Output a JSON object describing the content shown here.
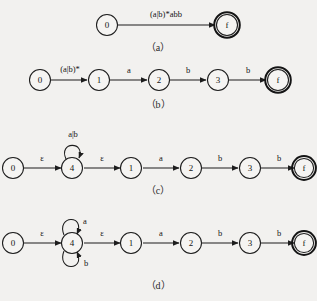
{
  "figure": {
    "background_color": "#f2f1ef",
    "ink_color": "#1d1d1d",
    "panels": [
      {
        "id": "a",
        "caption": "（a）",
        "states": [
          {
            "name": "0",
            "accepting": false
          },
          {
            "name": "f",
            "accepting": true
          }
        ],
        "transitions": [
          {
            "from": "0",
            "to": "f",
            "label": "(a|b)*abb",
            "kind": "edge"
          }
        ]
      },
      {
        "id": "b",
        "caption": "（b）",
        "states": [
          {
            "name": "0",
            "accepting": false
          },
          {
            "name": "1",
            "accepting": false
          },
          {
            "name": "2",
            "accepting": false
          },
          {
            "name": "3",
            "accepting": false
          },
          {
            "name": "f",
            "accepting": true
          }
        ],
        "transitions": [
          {
            "from": "0",
            "to": "1",
            "label": "(a|b)*",
            "kind": "edge"
          },
          {
            "from": "1",
            "to": "2",
            "label": "a",
            "kind": "edge"
          },
          {
            "from": "2",
            "to": "3",
            "label": "b",
            "kind": "edge"
          },
          {
            "from": "3",
            "to": "f",
            "label": "b",
            "kind": "edge"
          }
        ]
      },
      {
        "id": "c",
        "caption": "（c）",
        "states": [
          {
            "name": "0",
            "accepting": false
          },
          {
            "name": "4",
            "accepting": false
          },
          {
            "name": "1",
            "accepting": false
          },
          {
            "name": "2",
            "accepting": false
          },
          {
            "name": "3",
            "accepting": false
          },
          {
            "name": "f",
            "accepting": true
          }
        ],
        "transitions": [
          {
            "from": "0",
            "to": "4",
            "label": "ε",
            "kind": "edge"
          },
          {
            "from": "4",
            "to": "4",
            "label": "a|b",
            "kind": "self-loop-top"
          },
          {
            "from": "4",
            "to": "1",
            "label": "ε",
            "kind": "edge"
          },
          {
            "from": "1",
            "to": "2",
            "label": "a",
            "kind": "edge"
          },
          {
            "from": "2",
            "to": "3",
            "label": "b",
            "kind": "edge"
          },
          {
            "from": "3",
            "to": "f",
            "label": "b",
            "kind": "edge"
          }
        ]
      },
      {
        "id": "d",
        "caption": "（d）",
        "states": [
          {
            "name": "0",
            "accepting": false
          },
          {
            "name": "4",
            "accepting": false
          },
          {
            "name": "1",
            "accepting": false
          },
          {
            "name": "2",
            "accepting": false
          },
          {
            "name": "3",
            "accepting": false
          },
          {
            "name": "f",
            "accepting": true
          }
        ],
        "transitions": [
          {
            "from": "0",
            "to": "4",
            "label": "ε",
            "kind": "edge"
          },
          {
            "from": "4",
            "to": "4",
            "label": "a",
            "kind": "self-loop-top"
          },
          {
            "from": "4",
            "to": "4",
            "label": "b",
            "kind": "self-loop-bottom"
          },
          {
            "from": "4",
            "to": "1",
            "label": "ε",
            "kind": "edge"
          },
          {
            "from": "1",
            "to": "2",
            "label": "a",
            "kind": "edge"
          },
          {
            "from": "2",
            "to": "3",
            "label": "b",
            "kind": "edge"
          },
          {
            "from": "3",
            "to": "f",
            "label": "b",
            "kind": "edge"
          }
        ]
      }
    ]
  }
}
